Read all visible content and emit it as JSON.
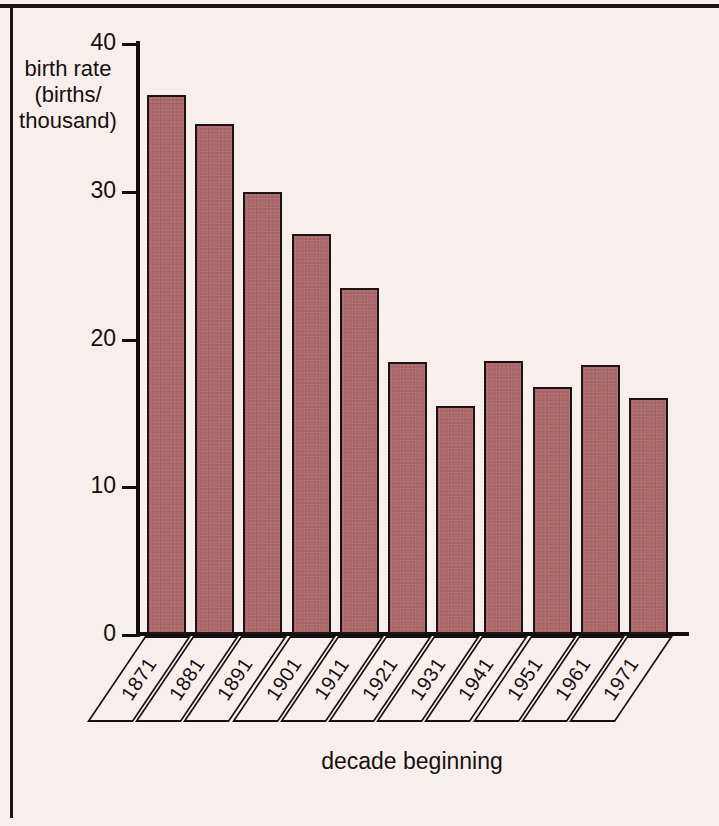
{
  "chart_data": {
    "type": "bar",
    "title": "",
    "xlabel": "decade beginning",
    "ylabel": "birth rate (births/thousand)",
    "ylabel_lines": [
      "birth rate",
      "(births/",
      "thousand)"
    ],
    "categories": [
      "1871",
      "1881",
      "1891",
      "1901",
      "1911",
      "1921",
      "1931",
      "1941",
      "1951",
      "1961",
      "1971"
    ],
    "values": [
      36.5,
      34.5,
      29.9,
      27.1,
      23.4,
      18.4,
      15.4,
      18.5,
      16.7,
      18.2,
      16.0
    ],
    "ylim": [
      0,
      40
    ],
    "yticks": [
      0,
      10,
      20,
      30,
      40
    ],
    "ytick_labels": [
      "0",
      "10",
      "20",
      "30",
      "40"
    ],
    "grid": false,
    "legend": false,
    "bar_color": "#ab6a6c",
    "bar_edge_color": "#1c1314",
    "background_color": "#f7efec",
    "axis_color": "#120e0f"
  }
}
